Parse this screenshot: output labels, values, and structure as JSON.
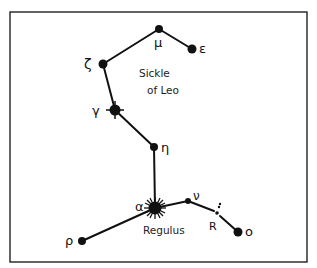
{
  "diagram": {
    "title_line1": "Sickle",
    "title_line2": "of Leo",
    "colors": {
      "ink": "#111111",
      "background": "#ffffff",
      "frame": "#222222"
    },
    "stars": [
      {
        "id": "mu",
        "label": "μ",
        "x": 159,
        "y": 29,
        "r": 4
      },
      {
        "id": "epsilon",
        "label": "ε",
        "x": 192,
        "y": 49,
        "r": 4.5
      },
      {
        "id": "zeta",
        "label": "ζ",
        "x": 103,
        "y": 64,
        "r": 4.5
      },
      {
        "id": "gamma",
        "label": "γ",
        "x": 115,
        "y": 110,
        "r": 5.5,
        "bright": true
      },
      {
        "id": "eta",
        "label": "η",
        "x": 154,
        "y": 147,
        "r": 4
      },
      {
        "id": "alpha",
        "label": "α",
        "name": "Regulus",
        "x": 155,
        "y": 208,
        "r": 6.5,
        "bright": true
      },
      {
        "id": "nu",
        "label": "ν",
        "x": 188,
        "y": 201,
        "r": 3
      },
      {
        "id": "R",
        "label": "R",
        "x": 217,
        "y": 213,
        "r": 1.8,
        "variable": true
      },
      {
        "id": "omicron",
        "label": "ο",
        "x": 238,
        "y": 232,
        "r": 4.5
      },
      {
        "id": "rho",
        "label": "ρ",
        "x": 82,
        "y": 241,
        "r": 4
      }
    ],
    "lines": [
      [
        "epsilon",
        "mu"
      ],
      [
        "mu",
        "zeta"
      ],
      [
        "zeta",
        "gamma"
      ],
      [
        "gamma",
        "eta"
      ],
      [
        "eta",
        "alpha"
      ],
      [
        "alpha",
        "nu"
      ],
      [
        "nu",
        "R"
      ],
      [
        "R",
        "omicron"
      ],
      [
        "alpha",
        "rho"
      ]
    ]
  }
}
